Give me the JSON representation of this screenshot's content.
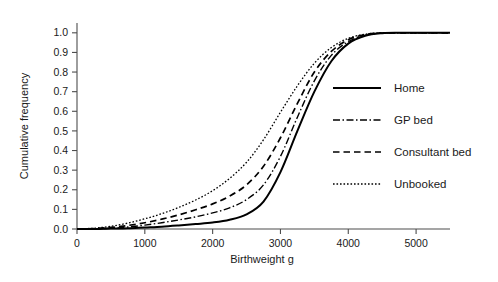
{
  "chart_data": {
    "type": "line",
    "title": "",
    "xlabel": "Birthweight g",
    "ylabel": "Cumulative frequency",
    "xlim": [
      0,
      5500
    ],
    "ylim": [
      0.0,
      1.05
    ],
    "grid": false,
    "legend_position": "right-middle",
    "xticks": [
      0,
      1000,
      2000,
      3000,
      4000,
      5000
    ],
    "xtick_labels": [
      "0",
      "1000",
      "2000",
      "3000",
      "4000",
      "5000"
    ],
    "yticks": [
      0.0,
      0.1,
      0.2,
      0.3,
      0.4,
      0.5,
      0.6,
      0.7,
      0.8,
      0.9,
      1.0
    ],
    "ytick_labels": [
      "0.0",
      "0.1",
      "0.2",
      "0.3",
      "0.4",
      "0.5",
      "0.6",
      "0.7",
      "0.8",
      "0.9",
      "1.0"
    ],
    "x": [
      0,
      250,
      500,
      750,
      1000,
      1250,
      1500,
      1750,
      2000,
      2250,
      2500,
      2750,
      3000,
      3250,
      3500,
      3750,
      4000,
      4250,
      4500,
      4750,
      5000,
      5250,
      5500
    ],
    "series": [
      {
        "name": "Home",
        "style": "solid",
        "values": [
          0.0,
          0.0,
          0.002,
          0.004,
          0.008,
          0.012,
          0.018,
          0.025,
          0.033,
          0.047,
          0.075,
          0.14,
          0.29,
          0.5,
          0.7,
          0.855,
          0.945,
          0.985,
          0.998,
          1.0,
          1.0,
          1.0,
          1.0
        ]
      },
      {
        "name": "GP bed",
        "style": "dash-dot",
        "values": [
          0.0,
          0.001,
          0.004,
          0.01,
          0.02,
          0.032,
          0.046,
          0.062,
          0.082,
          0.108,
          0.15,
          0.225,
          0.37,
          0.57,
          0.755,
          0.885,
          0.955,
          0.988,
          0.999,
          1.0,
          1.0,
          1.0,
          1.0
        ]
      },
      {
        "name": "Consultant bed",
        "style": "dashed",
        "values": [
          0.0,
          0.002,
          0.008,
          0.018,
          0.032,
          0.05,
          0.072,
          0.098,
          0.128,
          0.168,
          0.225,
          0.32,
          0.465,
          0.64,
          0.8,
          0.905,
          0.965,
          0.991,
          0.999,
          1.0,
          1.0,
          1.0,
          1.0
        ]
      },
      {
        "name": "Unbooked",
        "style": "dotted",
        "values": [
          0.0,
          0.004,
          0.014,
          0.03,
          0.052,
          0.078,
          0.11,
          0.148,
          0.195,
          0.258,
          0.34,
          0.455,
          0.595,
          0.73,
          0.845,
          0.925,
          0.972,
          0.993,
          1.0,
          1.0,
          1.0,
          1.0,
          1.0
        ]
      }
    ],
    "legend_entries": [
      "Home",
      "GP bed",
      "Consultant bed",
      "Unbooked"
    ]
  }
}
